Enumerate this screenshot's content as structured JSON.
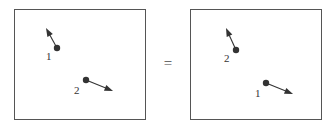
{
  "figure": {
    "background_color": "#ffffff",
    "stroke_color": "#333333",
    "frame_color": "#555555",
    "relation_symbol": "=",
    "panels": [
      {
        "id": "left",
        "name": "left-panel",
        "frame": {
          "x": 14,
          "y": 9,
          "width": 132,
          "height": 111
        },
        "particles": [
          {
            "label": "1",
            "dot": {
              "x": 57,
              "y": 48,
              "r": 3.2
            },
            "arrow": {
              "x1": 57,
              "y1": 48,
              "x2": 46,
              "y2": 28
            },
            "label_pos": {
              "x": 46,
              "y": 51
            }
          },
          {
            "label": "2",
            "dot": {
              "x": 86,
              "y": 80,
              "r": 3.2
            },
            "arrow": {
              "x1": 86,
              "y1": 80,
              "x2": 113,
              "y2": 91
            },
            "label_pos": {
              "x": 74,
              "y": 85
            }
          }
        ]
      },
      {
        "id": "right",
        "name": "right-panel",
        "frame": {
          "x": 190,
          "y": 9,
          "width": 132,
          "height": 111
        },
        "particles": [
          {
            "label": "2",
            "dot": {
              "x": 236,
              "y": 50,
              "r": 3.2
            },
            "arrow": {
              "x1": 236,
              "y1": 50,
              "x2": 226,
              "y2": 28
            },
            "label_pos": {
              "x": 224,
              "y": 53
            }
          },
          {
            "label": "1",
            "dot": {
              "x": 266,
              "y": 83,
              "r": 3.2
            },
            "arrow": {
              "x1": 266,
              "y1": 83,
              "x2": 293,
              "y2": 94
            },
            "label_pos": {
              "x": 255,
              "y": 88
            }
          }
        ]
      }
    ]
  },
  "chart_data": {
    "type": "scatter",
    "title": "",
    "xlabel": "",
    "ylabel": "",
    "legend": [],
    "grid": false,
    "series": [
      {
        "name": "left-panel",
        "points": [
          {
            "label": "1",
            "x": 57,
            "y": 48,
            "vx": -11,
            "vy": -20
          },
          {
            "label": "2",
            "x": 86,
            "y": 80,
            "vx": 27,
            "vy": 11
          }
        ]
      },
      {
        "name": "right-panel",
        "points": [
          {
            "label": "2",
            "x": 236,
            "y": 50,
            "vx": -10,
            "vy": -22
          },
          {
            "label": "1",
            "x": 266,
            "y": 83,
            "vx": 27,
            "vy": 11
          }
        ]
      }
    ]
  }
}
